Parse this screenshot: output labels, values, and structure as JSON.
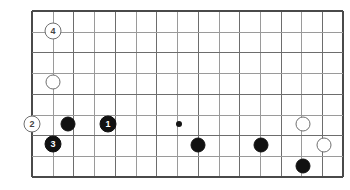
{
  "board": {
    "title": "Go board diagram",
    "width": 350,
    "height": 190,
    "origin_x": 32,
    "origin_y": 11,
    "step": 20.73,
    "columns": 16,
    "rows": 9,
    "line_color": "#9a9a9a",
    "major_line_color": "#6d6d6d",
    "edge_color": "#4a4a4a",
    "background": "#ffffff",
    "major_every": 2,
    "hoshi": [
      {
        "col": 7,
        "row": 5.45,
        "x": 179,
        "y": 124
      }
    ],
    "stones": [
      {
        "id": "s-white-4",
        "color": "white",
        "label": "4",
        "x": 53,
        "y": 31,
        "col": 1,
        "row": 1
      },
      {
        "id": "s-white-a",
        "color": "white",
        "label": "",
        "x": 53,
        "y": 82,
        "col": 1,
        "row": 3.4
      },
      {
        "id": "s-white-2",
        "color": "white",
        "label": "2",
        "x": 32,
        "y": 124,
        "col": 0,
        "row": 5.45
      },
      {
        "id": "s-black-a",
        "color": "black",
        "label": "",
        "x": 68,
        "y": 124,
        "col": 1.7,
        "row": 5.45
      },
      {
        "id": "s-black-1",
        "color": "black",
        "label": "1",
        "x": 108,
        "y": 124,
        "col": 3.65,
        "row": 5.45
      },
      {
        "id": "s-black-3",
        "color": "black",
        "label": "3",
        "x": 53,
        "y": 144,
        "col": 1,
        "row": 6.4
      },
      {
        "id": "s-black-b",
        "color": "black",
        "label": "",
        "x": 198,
        "y": 145,
        "col": 8,
        "row": 6.45
      },
      {
        "id": "s-black-c",
        "color": "black",
        "label": "",
        "x": 261,
        "y": 145,
        "col": 11,
        "row": 6.45
      },
      {
        "id": "s-white-b",
        "color": "white",
        "label": "",
        "x": 303,
        "y": 124,
        "col": 13,
        "row": 5.45
      },
      {
        "id": "s-white-c",
        "color": "white",
        "label": "",
        "x": 324,
        "y": 145,
        "col": 14,
        "row": 6.45
      },
      {
        "id": "s-black-d",
        "color": "black",
        "label": "",
        "x": 303,
        "y": 166,
        "col": 13,
        "row": 7.45
      }
    ],
    "move_sequence": [
      "1",
      "2",
      "3",
      "4"
    ]
  }
}
